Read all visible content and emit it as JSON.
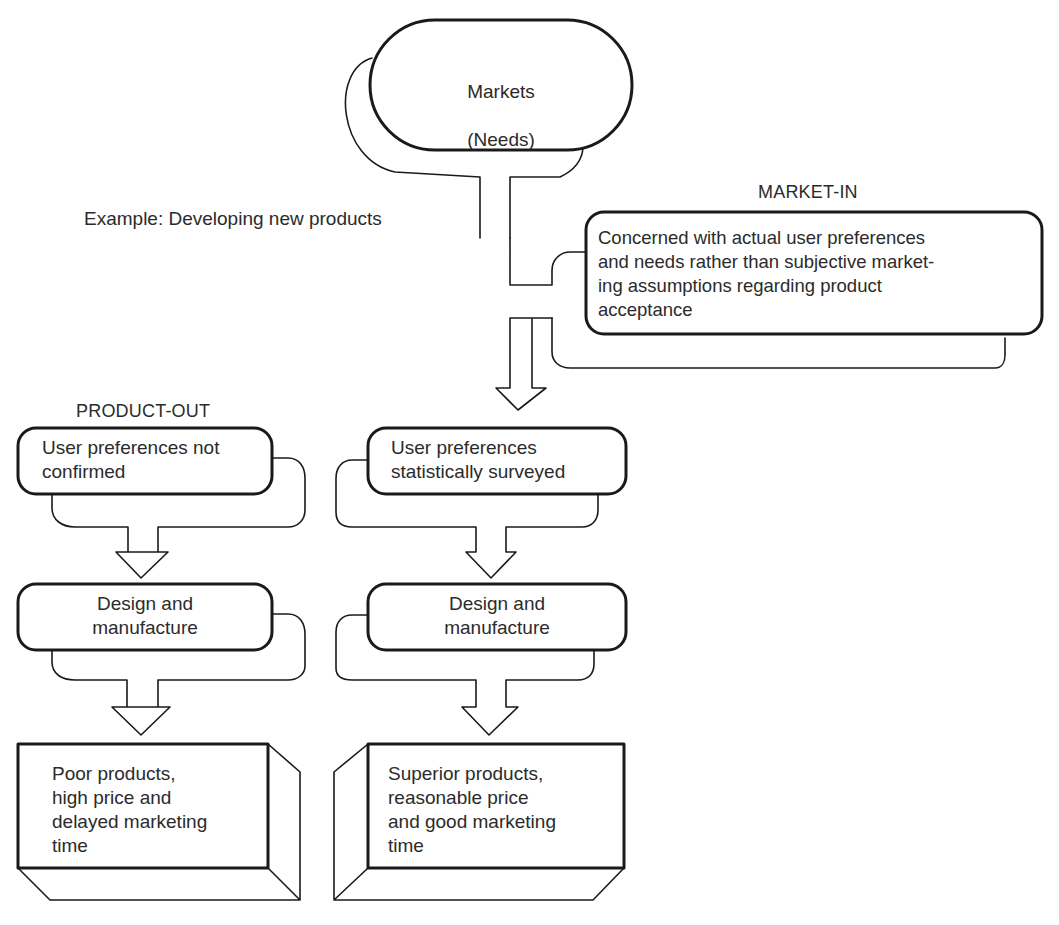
{
  "diagram": {
    "top_node": {
      "line1": "Markets",
      "line2": "(Needs)"
    },
    "example_label": "Example: Developing new products",
    "market_in": {
      "heading": "MARKET-IN",
      "description": "Concerned with actual user preferences\nand needs rather than subjective market-\ning assumptions regarding product\nacceptance"
    },
    "product_out": {
      "heading": "PRODUCT-OUT",
      "step1": "User preferences not\nconfirmed",
      "step2": "Design and\nmanufacture",
      "result": "Poor products,\nhigh price and\ndelayed marketing\ntime"
    },
    "market_in_flow": {
      "step1": "User preferences\nstatistically surveyed",
      "step2": "Design and\nmanufacture",
      "result": "Superior products,\nreasonable price\nand good marketing\ntime"
    },
    "colors": {
      "stroke": "#1a1a1a",
      "background": "#ffffff",
      "text": "#2b2b2b"
    }
  }
}
